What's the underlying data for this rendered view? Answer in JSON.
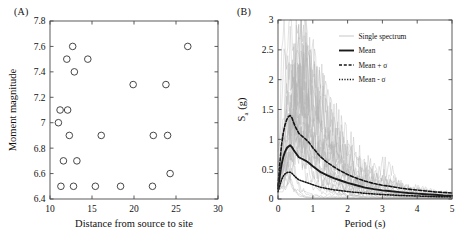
{
  "figure": {
    "panel_a_label": "(A)",
    "panel_b_label": "(B)"
  },
  "chart_data": [
    {
      "id": "panel-a",
      "type": "scatter",
      "title": "",
      "xlabel": "Distance from source to site",
      "ylabel": "Moment magnitude",
      "xlim": [
        10,
        30
      ],
      "ylim": [
        6.4,
        7.8
      ],
      "xticks": [
        10,
        15,
        20,
        25,
        30
      ],
      "xtick_labels": [
        "10",
        "15",
        "20",
        "25",
        "30"
      ],
      "yticks": [
        6.4,
        6.6,
        6.8,
        7,
        7.2,
        7.4,
        7.6,
        7.8
      ],
      "ytick_labels": [
        "6.4",
        "6.6",
        "6.8",
        "7",
        "7.2",
        "7.4",
        "7.6",
        "7.8"
      ],
      "grid": false,
      "marker": "open-circle",
      "points": [
        {
          "x": 11.0,
          "y": 7.0
        },
        {
          "x": 11.2,
          "y": 7.1
        },
        {
          "x": 11.3,
          "y": 6.5
        },
        {
          "x": 11.6,
          "y": 6.7
        },
        {
          "x": 12.0,
          "y": 7.5
        },
        {
          "x": 12.1,
          "y": 7.1
        },
        {
          "x": 12.3,
          "y": 6.9
        },
        {
          "x": 12.7,
          "y": 7.6
        },
        {
          "x": 12.8,
          "y": 6.5
        },
        {
          "x": 12.9,
          "y": 7.4
        },
        {
          "x": 13.2,
          "y": 6.7
        },
        {
          "x": 14.5,
          "y": 7.5
        },
        {
          "x": 15.4,
          "y": 6.5
        },
        {
          "x": 16.1,
          "y": 6.9
        },
        {
          "x": 18.4,
          "y": 6.5
        },
        {
          "x": 19.9,
          "y": 7.3
        },
        {
          "x": 22.2,
          "y": 6.5
        },
        {
          "x": 22.3,
          "y": 6.9
        },
        {
          "x": 23.8,
          "y": 7.3
        },
        {
          "x": 24.0,
          "y": 6.9
        },
        {
          "x": 24.3,
          "y": 6.6
        },
        {
          "x": 26.4,
          "y": 7.6
        }
      ]
    },
    {
      "id": "panel-b",
      "type": "line",
      "title": "",
      "xlabel": "Period (s)",
      "ylabel": "S_a (g)",
      "ylabel_main": "S",
      "ylabel_sub": "a",
      "ylabel_unit": " (g)",
      "xlim": [
        0,
        5
      ],
      "ylim": [
        0,
        3
      ],
      "xticks": [
        0,
        1,
        2,
        3,
        4,
        5
      ],
      "xtick_labels": [
        "0",
        "1",
        "2",
        "3",
        "4",
        "5"
      ],
      "yticks": [
        0,
        0.5,
        1,
        1.5,
        2,
        2.5,
        3
      ],
      "ytick_labels": [
        "0",
        "0.5",
        "1",
        "1.5",
        "2",
        "2.5",
        "3"
      ],
      "grid": false,
      "legend_position": "top-right",
      "legend": [
        {
          "label": "Single spectrum",
          "style": "thin-gray"
        },
        {
          "label": "Mean",
          "style": "thick-solid"
        },
        {
          "label": "Mean + σ",
          "style": "dashed"
        },
        {
          "label": "Mean - σ",
          "style": "dotted"
        }
      ],
      "x": [
        0,
        0.05,
        0.1,
        0.15,
        0.2,
        0.25,
        0.3,
        0.35,
        0.4,
        0.45,
        0.5,
        0.6,
        0.7,
        0.8,
        0.9,
        1.0,
        1.2,
        1.4,
        1.6,
        1.8,
        2.0,
        2.25,
        2.5,
        2.75,
        3.0,
        3.25,
        3.5,
        3.75,
        4.0,
        4.25,
        4.5,
        4.75,
        5.0
      ],
      "series": [
        {
          "name": "Mean",
          "style": "thick-solid",
          "values": [
            0.17,
            0.38,
            0.57,
            0.7,
            0.79,
            0.85,
            0.88,
            0.9,
            0.87,
            0.82,
            0.78,
            0.7,
            0.67,
            0.64,
            0.6,
            0.55,
            0.46,
            0.4,
            0.35,
            0.31,
            0.27,
            0.23,
            0.19,
            0.165,
            0.145,
            0.13,
            0.115,
            0.1,
            0.09,
            0.08,
            0.07,
            0.06,
            0.055
          ]
        },
        {
          "name": "Mean + σ",
          "style": "dashed",
          "values": [
            0.22,
            0.58,
            0.9,
            1.1,
            1.24,
            1.33,
            1.38,
            1.4,
            1.36,
            1.28,
            1.21,
            1.1,
            1.05,
            1.0,
            0.94,
            0.86,
            0.72,
            0.62,
            0.54,
            0.47,
            0.41,
            0.35,
            0.3,
            0.26,
            0.23,
            0.21,
            0.185,
            0.165,
            0.15,
            0.135,
            0.12,
            0.11,
            0.1
          ]
        },
        {
          "name": "Mean - σ",
          "style": "dotted",
          "values": [
            0.12,
            0.22,
            0.32,
            0.38,
            0.42,
            0.44,
            0.45,
            0.45,
            0.43,
            0.4,
            0.37,
            0.32,
            0.3,
            0.28,
            0.26,
            0.24,
            0.2,
            0.175,
            0.155,
            0.14,
            0.125,
            0.11,
            0.095,
            0.085,
            0.075,
            0.068,
            0.06,
            0.055,
            0.05,
            0.045,
            0.04,
            0.038,
            0.035
          ]
        }
      ],
      "single_spectra_count": 30,
      "single_spectra_peak_range": [
        0.6,
        2.7
      ],
      "single_spectra_peak_period_range": [
        0.15,
        0.9
      ]
    }
  ]
}
